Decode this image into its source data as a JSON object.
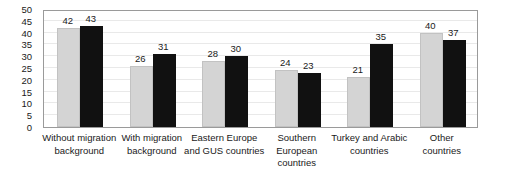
{
  "chart_data": {
    "type": "bar",
    "title": "",
    "subtitle": "",
    "xlabel": "",
    "ylabel": "",
    "ylim": [
      0,
      50
    ],
    "ytick_step": 5,
    "yticks": [
      50,
      45,
      40,
      35,
      30,
      25,
      20,
      15,
      10,
      5,
      0
    ],
    "grid": true,
    "grid_axis": "y",
    "legend": false,
    "legend_position": "none",
    "categories": [
      "Without migration background",
      "With migration background",
      "Eastern Europe and GUS countries",
      "Southern European countries",
      "Turkey and Arabic countries",
      "Other countries"
    ],
    "category_label_lines": [
      [
        "Without migration",
        "background"
      ],
      [
        "With migration",
        "background"
      ],
      [
        "Eastern Europe",
        "and GUS countries"
      ],
      [
        "Southern",
        "European",
        "countries"
      ],
      [
        "Turkey and Arabic",
        "countries"
      ],
      [
        "Other",
        "countries"
      ]
    ],
    "series": [
      {
        "name": "series-1",
        "color": "#d4d4d4",
        "values": [
          42,
          26,
          28,
          24,
          21,
          40
        ]
      },
      {
        "name": "series-2",
        "color": "#111111",
        "values": [
          43,
          31,
          30,
          23,
          35,
          37
        ]
      }
    ],
    "data_labels": [
      [
        42,
        43
      ],
      [
        26,
        31
      ],
      [
        28,
        30
      ],
      [
        24,
        23
      ],
      [
        21,
        35
      ],
      [
        40,
        37
      ]
    ]
  },
  "colors": {
    "series_1": "#d4d4d4",
    "series_2": "#111111",
    "frame": "#9a9a9a",
    "grid": "#e9e9e9",
    "text": "#1a1a1a",
    "background": "#ffffff"
  }
}
